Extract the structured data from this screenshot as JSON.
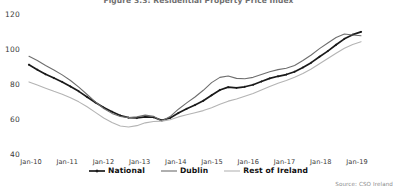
{
  "chart_data": {
    "type": "line",
    "title": "Figure 3.3: Residential Property Price Index",
    "xlabel": "",
    "ylabel": "",
    "ylim": [
      40,
      120
    ],
    "yticks": [
      40,
      60,
      80,
      100,
      120
    ],
    "xticks": [
      "Jan-10",
      "Jan-11",
      "Jan-12",
      "Jan-13",
      "Jan-14",
      "Jan-15",
      "Jan-16",
      "Jan-17",
      "Jan-18",
      "Jan-19"
    ],
    "grid": false,
    "legend_position": "bottom",
    "source": "Source: CSO Ireland",
    "x": [
      "Jan-10",
      "Apr-10",
      "Jul-10",
      "Oct-10",
      "Jan-11",
      "Apr-11",
      "Jul-11",
      "Oct-11",
      "Jan-12",
      "Apr-12",
      "Jul-12",
      "Oct-12",
      "Jan-13",
      "Apr-13",
      "Jul-13",
      "Oct-13",
      "Jan-14",
      "Apr-14",
      "Jul-14",
      "Oct-14",
      "Jan-15",
      "Apr-15",
      "Jul-15",
      "Oct-15",
      "Jan-16",
      "Apr-16",
      "Jul-16",
      "Oct-16",
      "Jan-17",
      "Apr-17",
      "Jul-17",
      "Oct-17",
      "Jan-18",
      "Apr-18",
      "Jul-18",
      "Oct-18",
      "Jan-19",
      "Apr-19",
      "Jul-19",
      "Oct-19"
    ],
    "series": [
      {
        "name": "National",
        "color": "#1a1a1a",
        "marker": "diamond",
        "values": [
          91.0,
          88.2,
          85.6,
          83.4,
          81.2,
          78.6,
          75.8,
          72.6,
          69.4,
          66.6,
          64.2,
          62.0,
          60.8,
          60.6,
          61.2,
          61.0,
          59.2,
          60.6,
          63.4,
          65.8,
          68.0,
          70.4,
          73.6,
          76.6,
          78.2,
          77.8,
          78.4,
          79.6,
          81.4,
          83.2,
          84.4,
          85.4,
          87.0,
          89.4,
          92.2,
          95.6,
          98.8,
          102.4,
          105.8,
          108.2
        ],
        "end_value": 109.8
      },
      {
        "name": "Dublin",
        "color": "#6e6e6e",
        "marker": "none",
        "values": [
          95.8,
          93.4,
          90.6,
          88.0,
          85.2,
          82.0,
          78.2,
          74.0,
          69.8,
          66.0,
          63.2,
          61.4,
          60.8,
          61.2,
          62.2,
          61.6,
          58.8,
          61.4,
          65.6,
          69.2,
          72.6,
          76.4,
          80.8,
          83.8,
          84.6,
          83.2,
          83.0,
          83.8,
          85.4,
          87.0,
          88.2,
          89.0,
          90.6,
          93.4,
          96.6,
          100.2,
          103.4,
          106.6,
          108.6,
          108.0
        ],
        "end_value": 107.6
      },
      {
        "name": "Rest of Ireland",
        "color": "#b4b4b4",
        "marker": "none",
        "values": [
          81.2,
          79.4,
          77.6,
          75.8,
          74.2,
          72.2,
          69.8,
          67.0,
          63.8,
          60.6,
          58.0,
          56.0,
          55.4,
          56.2,
          57.8,
          58.6,
          58.8,
          59.6,
          61.2,
          62.4,
          63.6,
          64.8,
          66.4,
          68.4,
          70.2,
          71.4,
          73.0,
          74.6,
          76.6,
          78.6,
          80.4,
          82.0,
          83.8,
          86.0,
          88.6,
          91.6,
          94.6,
          97.6,
          100.4,
          102.6
        ],
        "end_value": 104.2
      }
    ]
  },
  "legend": {
    "items": [
      {
        "label": "National"
      },
      {
        "label": "Dublin"
      },
      {
        "label": "Rest of Ireland"
      }
    ]
  }
}
